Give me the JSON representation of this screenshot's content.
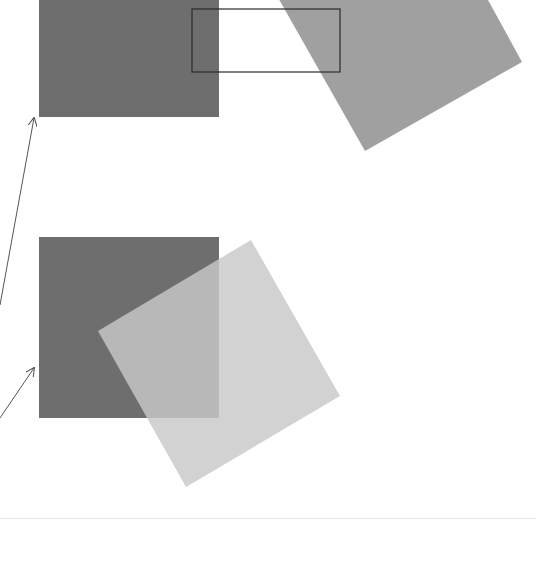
{
  "figure": {
    "colors": {
      "background": "#ffffff",
      "opaque_square": "#6e6e6e",
      "rotated_square_top": "#a0a0a0",
      "rotated_square_bottom": "#c8c8c8",
      "overlap_bottom": "#8e8e8e",
      "outline_rect": "#2a2a2a",
      "arrow": "#555555",
      "divider": "#e4e4e4"
    },
    "panels": [
      {
        "name": "top-panel",
        "opaque_square": {
          "x": 39,
          "y": -63,
          "w": 180,
          "h": 180
        },
        "rotated_square_points": "280,0 488,0 522,62 365,151 251,-50",
        "outline_rect": {
          "x": 192,
          "y": 9,
          "w": 148,
          "h": 63
        },
        "arrow": {
          "x1": 0,
          "y1": 305,
          "x2": 34,
          "y2": 118
        }
      },
      {
        "name": "bottom-panel",
        "opaque_square": {
          "x": 39,
          "y": 237,
          "w": 180,
          "h": 181
        },
        "rotated_square_points": "251,240 340,396 186,487 98,331",
        "arrow": {
          "x1": 0,
          "y1": 418,
          "x2": 34,
          "y2": 368
        }
      }
    ]
  }
}
